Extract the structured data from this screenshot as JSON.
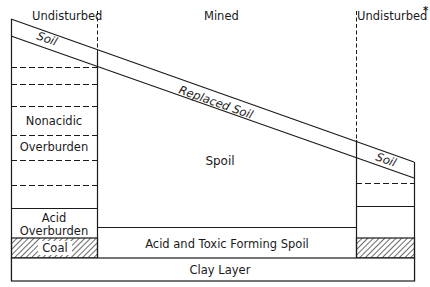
{
  "diagram": {
    "type": "cross-section",
    "zones": {
      "left": "Undisturbed",
      "middle": "Mined",
      "right": "Undisturbed",
      "right_marker": "*"
    },
    "layers": {
      "soil_left": "Soil",
      "replaced_soil": "Replaced Soil",
      "soil_right": "Soil",
      "nonacidic_line1": "Nonacidic",
      "nonacidic_line2": "Overburden",
      "spoil": "Spoil",
      "acid_line1": "Acid",
      "acid_line2": "Overburden",
      "coal": "Coal",
      "acid_toxic_spoil": "Acid and Toxic Forming Spoil",
      "clay": "Clay Layer"
    },
    "colors": {
      "line": "#1a1a1a",
      "background": "#ffffff"
    }
  }
}
